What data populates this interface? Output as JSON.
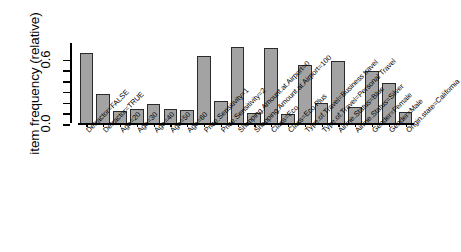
{
  "chart_data": {
    "type": "bar",
    "title": "",
    "subtitle": "",
    "xlabel": "",
    "ylabel": "item frequency (relative)",
    "ylim": [
      0.0,
      0.8
    ],
    "grid": false,
    "legend": "none",
    "y_tick_values": [
      0.0,
      0.2,
      0.4,
      0.6
    ],
    "y_tick_labels_shown": [
      "0.0",
      "",
      "",
      "0.6"
    ],
    "bar_color": "#a3a3a3",
    "bar_border_color": "#2b2b2b",
    "categories": [
      "Detractor=FALSE",
      "Detractor=TRUE",
      "Age=20",
      "Age=30",
      "Age=40",
      "Age=50",
      "Age=60",
      "Price.Sensitivity=1",
      "Price.Sensitivity=2",
      "Shopping.Amount.at.Airport=0",
      "Shopping.Amount.at.Airport=100",
      "Class=Eco",
      "Class=Eco Plus",
      "Type.of.Travel=Business travel",
      "Type.of.Travel=Personal Travel",
      "Airline.Status=Blue",
      "Airline.Status=Silver",
      "Gender=Female",
      "Gender=Male",
      "Origin.state=California"
    ],
    "values": [
      0.66,
      0.28,
      0.12,
      0.14,
      0.19,
      0.14,
      0.13,
      0.63,
      0.21,
      0.72,
      0.1,
      0.71,
      0.09,
      0.55,
      0.2,
      0.59,
      0.16,
      0.49,
      0.38,
      0.11
    ]
  },
  "axis": {
    "y_label_0": "0.0",
    "y_label_6": "0.6"
  }
}
